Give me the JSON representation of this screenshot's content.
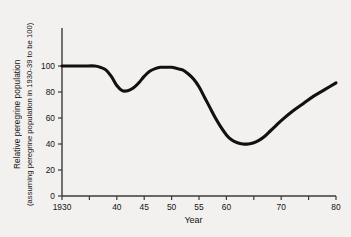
{
  "chart_data": {
    "type": "line",
    "title": "",
    "xlabel": "Year",
    "ylabel_line1": "Relative peregrine population",
    "ylabel_line2": "(assuming peregrine population in 1930-39 to be 100)",
    "xlim": [
      1930,
      1980
    ],
    "ylim": [
      0,
      105
    ],
    "grid": false,
    "legend": null,
    "line_color": "#111111",
    "axis_color": "#3a3a3a",
    "background_color": "#f2f1ef",
    "xticks": [
      {
        "value": 1930,
        "label": "1930"
      },
      {
        "value": 1935,
        "label": ""
      },
      {
        "value": 1940,
        "label": "40"
      },
      {
        "value": 1945,
        "label": "45"
      },
      {
        "value": 1950,
        "label": "50"
      },
      {
        "value": 1955,
        "label": "55"
      },
      {
        "value": 1960,
        "label": "60"
      },
      {
        "value": 1965,
        "label": ""
      },
      {
        "value": 1970,
        "label": "70"
      },
      {
        "value": 1975,
        "label": ""
      },
      {
        "value": 1980,
        "label": "80"
      }
    ],
    "yticks": [
      {
        "value": 0,
        "label": "0"
      },
      {
        "value": 20,
        "label": "20"
      },
      {
        "value": 40,
        "label": "40"
      },
      {
        "value": 60,
        "label": "60"
      },
      {
        "value": 80,
        "label": "80"
      },
      {
        "value": 100,
        "label": "100"
      }
    ],
    "series": [
      {
        "name": "Relative peregrine population",
        "x": [
          1930,
          1932,
          1934,
          1936,
          1937,
          1938,
          1939,
          1940,
          1941,
          1942,
          1943,
          1944,
          1945,
          1946,
          1947,
          1948,
          1949,
          1950,
          1951,
          1952,
          1953,
          1954,
          1955,
          1956,
          1957,
          1958,
          1959,
          1960,
          1961,
          1962,
          1963,
          1964,
          1965,
          1966,
          1967,
          1968,
          1969,
          1970,
          1972,
          1974,
          1976,
          1978,
          1980
        ],
        "values": [
          100,
          100,
          100,
          100,
          99,
          97,
          92,
          85,
          81,
          81,
          83,
          87,
          92,
          96,
          98,
          99,
          99,
          99,
          98,
          97,
          94,
          90,
          84,
          76,
          68,
          60,
          53,
          47,
          43,
          41,
          40,
          40,
          41,
          43,
          46,
          50,
          54,
          58,
          65,
          71,
          77,
          82,
          87
        ]
      }
    ]
  }
}
